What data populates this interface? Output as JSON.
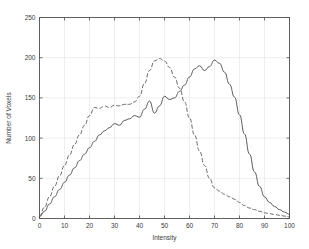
{
  "chart_data": {
    "type": "line",
    "title": "",
    "xlabel": "Intensity",
    "ylabel": "Number of Voxels",
    "xlim": [
      0,
      100
    ],
    "ylim": [
      0,
      250
    ],
    "xticks": [
      0,
      10,
      20,
      30,
      40,
      50,
      60,
      70,
      80,
      90,
      100
    ],
    "yticks": [
      0,
      50,
      100,
      150,
      200,
      250
    ],
    "xtick_labels": [
      "0",
      "10",
      "20",
      "30",
      "40",
      "50",
      "60",
      "70",
      "80",
      "90",
      "100"
    ],
    "ytick_labels": [
      "0",
      "50",
      "100",
      "150",
      "200",
      "250"
    ],
    "grid": true,
    "legend": null,
    "legend_position": "none",
    "background": "#ffffff",
    "axis_color": "#4d4d4d",
    "grid_color": "#e3e3e3",
    "series": [
      {
        "name": "solid-curve",
        "style": "solid",
        "color": "#4a4a4a",
        "width": 0.9,
        "x": [
          0,
          2,
          4,
          6,
          8,
          10,
          12,
          14,
          16,
          18,
          20,
          22,
          24,
          26,
          28,
          30,
          32,
          34,
          36,
          38,
          40,
          42,
          44,
          46,
          48,
          50,
          52,
          54,
          56,
          58,
          60,
          62,
          64,
          66,
          68,
          70,
          72,
          74,
          76,
          78,
          80,
          82,
          84,
          86,
          88,
          90,
          92,
          94,
          96,
          98,
          100
        ],
        "values": [
          2,
          9,
          18,
          27,
          36,
          45,
          54,
          63,
          72,
          80,
          88,
          96,
          104,
          109,
          113,
          118,
          116,
          122,
          124,
          128,
          126,
          136,
          146,
          131,
          140,
          152,
          148,
          150,
          158,
          166,
          176,
          186,
          190,
          184,
          189,
          197,
          193,
          182,
          167,
          151,
          129,
          105,
          80,
          58,
          40,
          27,
          20,
          15,
          11,
          8,
          5
        ]
      },
      {
        "name": "dashed-curve",
        "style": "dashed",
        "color": "#5a5a5a",
        "width": 0.9,
        "x": [
          0,
          2,
          4,
          6,
          8,
          10,
          12,
          14,
          16,
          18,
          20,
          22,
          24,
          26,
          28,
          30,
          32,
          34,
          36,
          38,
          40,
          42,
          44,
          46,
          48,
          50,
          52,
          54,
          56,
          58,
          60,
          62,
          64,
          66,
          68,
          70,
          72,
          74,
          76,
          78,
          80,
          82,
          84,
          86,
          88,
          90,
          92,
          94,
          96,
          98,
          100
        ],
        "values": [
          3,
          14,
          27,
          40,
          53,
          66,
          79,
          92,
          104,
          116,
          128,
          138,
          137,
          140,
          138,
          141,
          140,
          142,
          142,
          145,
          152,
          168,
          184,
          196,
          199,
          196,
          188,
          176,
          162,
          145,
          125,
          104,
          84,
          66,
          50,
          38,
          34,
          30,
          27,
          24,
          20,
          16,
          13,
          11,
          9,
          7,
          6,
          5,
          4,
          3,
          2
        ]
      }
    ]
  }
}
